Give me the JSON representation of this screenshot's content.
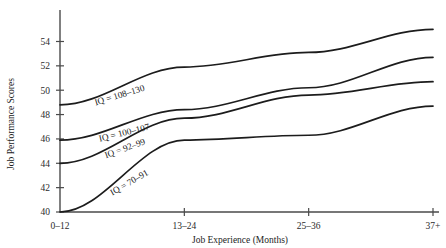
{
  "chart_data": {
    "type": "line",
    "title": "",
    "xlabel": "Job Experience (Months)",
    "ylabel": "Job Performance Scores",
    "categories": [
      "0–12",
      "13–24",
      "25–36",
      "37+"
    ],
    "yticks": [
      40,
      42,
      44,
      46,
      48,
      50,
      52,
      54
    ],
    "ytick_labels": [
      "40",
      "42",
      "44",
      "46",
      "48",
      "50",
      "52",
      "54"
    ],
    "ylim": [
      40,
      55.6
    ],
    "grid": false,
    "legend": "inline-labels-on-lines",
    "series": [
      {
        "name": "IQ = 108–130",
        "label": "IQ = 108–130",
        "values": [
          48.8,
          51.9,
          53.1,
          55.0
        ]
      },
      {
        "name": "IQ = 100–107",
        "label": "IQ = 100–107",
        "values": [
          45.9,
          48.4,
          50.2,
          52.7
        ]
      },
      {
        "name": "IQ = 92–99",
        "label": "IQ = 92–99",
        "values": [
          44.0,
          47.7,
          49.6,
          50.7
        ]
      },
      {
        "name": "IQ = 70–91",
        "label": "IQ = 70–91",
        "values": [
          40.0,
          45.9,
          46.3,
          48.7
        ]
      }
    ],
    "colors": {
      "line": "#1c1c1c",
      "axis": "#4a4a4a",
      "text": "#1c1c1c",
      "background": "#ffffff"
    }
  }
}
